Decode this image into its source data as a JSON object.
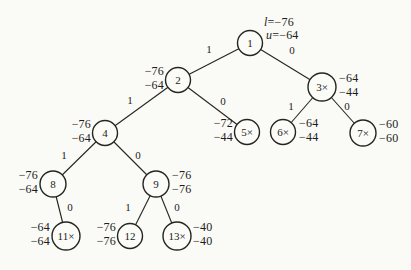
{
  "diagram": {
    "kind": "branch-and-bound-tree",
    "root_annotation": {
      "l_var": "l",
      "l_rest": "=−76",
      "u_var": "u",
      "u_rest": "=−64"
    },
    "nodes": [
      {
        "id": "1",
        "label": "1",
        "ann1": "",
        "ann2": ""
      },
      {
        "id": "2",
        "label": "2",
        "ann1": "−76",
        "ann2": "−64"
      },
      {
        "id": "3",
        "label": "3×",
        "ann1": "−64",
        "ann2": "−44"
      },
      {
        "id": "4",
        "label": "4",
        "ann1": "−76",
        "ann2": "−64"
      },
      {
        "id": "5",
        "label": "5×",
        "ann1": "−72",
        "ann2": "−44"
      },
      {
        "id": "6",
        "label": "6×",
        "ann1": "−64",
        "ann2": "−44"
      },
      {
        "id": "7",
        "label": "7×",
        "ann1": "−60",
        "ann2": "−60"
      },
      {
        "id": "8",
        "label": "8",
        "ann1": "−76",
        "ann2": "−64"
      },
      {
        "id": "9",
        "label": "9",
        "ann1": "−76",
        "ann2": "−76"
      },
      {
        "id": "11",
        "label": "11×",
        "ann1": "−64",
        "ann2": "−64"
      },
      {
        "id": "12",
        "label": "12",
        "ann1": "−76",
        "ann2": "−76"
      },
      {
        "id": "13",
        "label": "13×",
        "ann1": "−40",
        "ann2": "−40"
      }
    ],
    "edges": [
      {
        "from": "1",
        "to": "2",
        "label": "1"
      },
      {
        "from": "1",
        "to": "3",
        "label": "0"
      },
      {
        "from": "2",
        "to": "4",
        "label": "1"
      },
      {
        "from": "2",
        "to": "5",
        "label": "0"
      },
      {
        "from": "3",
        "to": "6",
        "label": "1"
      },
      {
        "from": "3",
        "to": "7",
        "label": "0"
      },
      {
        "from": "4",
        "to": "8",
        "label": "1"
      },
      {
        "from": "4",
        "to": "9",
        "label": "0"
      },
      {
        "from": "8",
        "to": "11",
        "label": "0"
      },
      {
        "from": "9",
        "to": "12",
        "label": "1"
      },
      {
        "from": "9",
        "to": "13",
        "label": "0"
      }
    ],
    "colors": {
      "ink": "#26261f",
      "paper": "#fafaf6"
    }
  }
}
